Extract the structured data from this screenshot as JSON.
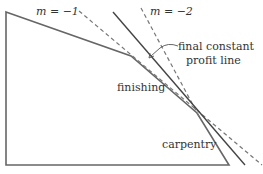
{
  "diagram": {
    "labels": {
      "slope_m1": "m = −1",
      "slope_m2": "m = −2",
      "annotation_line1": "final constant",
      "annotation_line2": "profit line",
      "finishing": "finishing",
      "carpentry": "carpentry"
    },
    "colors": {
      "stroke": "#555555",
      "dashed": "#666666",
      "text": "#333333",
      "background": "#ffffff"
    },
    "feasible_region": {
      "vertices": [
        [
          6,
          12
        ],
        [
          131,
          56
        ],
        [
          197,
          113
        ],
        [
          229,
          165
        ],
        [
          6,
          165
        ]
      ]
    },
    "lines": {
      "m_minus_1": {
        "from": [
          79,
          11
        ],
        "to": [
          262,
          165
        ],
        "style": "dashed"
      },
      "m_minus_2": {
        "from": [
          141,
          8
        ],
        "to": [
          201,
          120
        ],
        "style": "dashed"
      },
      "final_profit": {
        "from": [
          113,
          12
        ],
        "to": [
          245,
          165
        ],
        "style": "solid"
      }
    }
  }
}
